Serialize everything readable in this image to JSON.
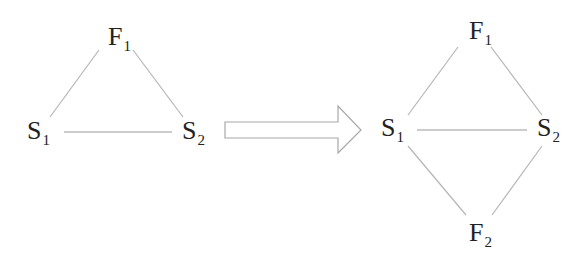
{
  "left_graph": {
    "nodes": [
      {
        "id": "F1",
        "letter": "F",
        "sub": "1"
      },
      {
        "id": "S1",
        "letter": "S",
        "sub": "1"
      },
      {
        "id": "S2",
        "letter": "S",
        "sub": "2"
      }
    ],
    "edges": [
      [
        "F1",
        "S1"
      ],
      [
        "F1",
        "S2"
      ],
      [
        "S1",
        "S2"
      ]
    ]
  },
  "arrow": {
    "direction": "right",
    "style": "hollow block arrow"
  },
  "right_graph": {
    "nodes": [
      {
        "id": "F1",
        "letter": "F",
        "sub": "1"
      },
      {
        "id": "S1",
        "letter": "S",
        "sub": "1"
      },
      {
        "id": "S2",
        "letter": "S",
        "sub": "2"
      },
      {
        "id": "F2",
        "letter": "F",
        "sub": "2"
      }
    ],
    "edges": [
      [
        "F1",
        "S1"
      ],
      [
        "F1",
        "S2"
      ],
      [
        "S1",
        "S2"
      ],
      [
        "S1",
        "F2"
      ],
      [
        "S2",
        "F2"
      ]
    ]
  },
  "colors": {
    "edge": "#b5b5b5",
    "text": "#222222",
    "arrow_stroke": "#a8a8a8"
  }
}
